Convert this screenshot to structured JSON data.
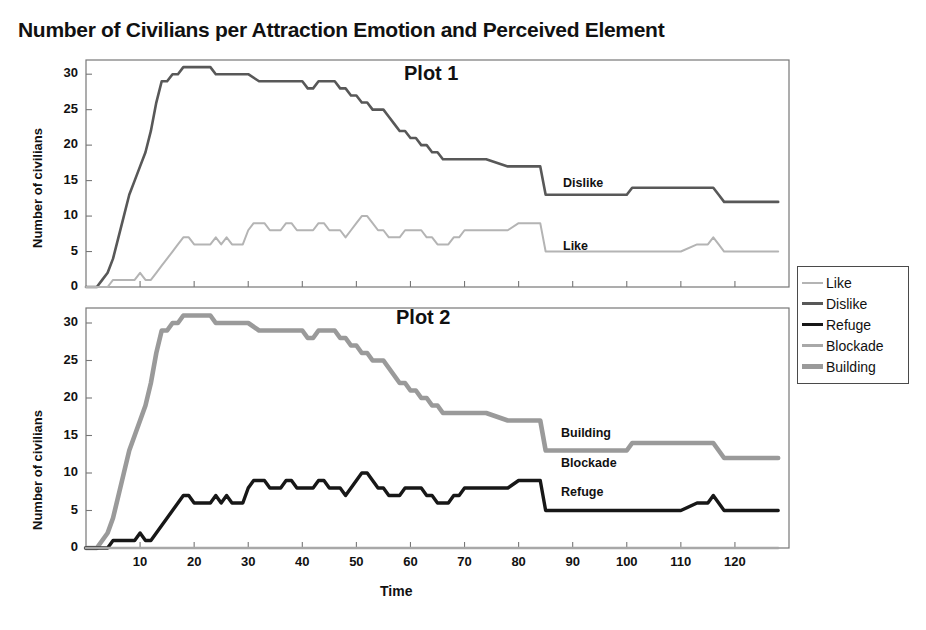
{
  "title": "Number of Civilians per Attraction Emotion and Perceived Element",
  "axis": {
    "xlabel": "Time",
    "ylabel": "Number of civilians",
    "yticks": [
      "0",
      "5",
      "10",
      "15",
      "20",
      "25",
      "30"
    ],
    "xticks": [
      "10",
      "20",
      "30",
      "40",
      "50",
      "60",
      "70",
      "80",
      "90",
      "100",
      "110",
      "120"
    ]
  },
  "plots": [
    {
      "tag": "Plot 1"
    },
    {
      "tag": "Plot 2"
    }
  ],
  "series_tags": {
    "dislike": "Dislike",
    "like": "Like",
    "building": "Building",
    "blockade": "Blockade",
    "refuge": "Refuge"
  },
  "legend": {
    "items": [
      {
        "label": "Like",
        "color": "#b4b4b4",
        "width": 2.0
      },
      {
        "label": "Dislike",
        "color": "#585858",
        "width": 2.6
      },
      {
        "label": "Refuge",
        "color": "#171717",
        "width": 3.4
      },
      {
        "label": "Blockade",
        "color": "#a8a8a8",
        "width": 2.4
      },
      {
        "label": "Building",
        "color": "#9a9a9a",
        "width": 4.6
      }
    ]
  },
  "chart_data": {
    "type": "line",
    "title": "Number of Civilians per Attraction Emotion and Perceived Element",
    "xlabel": "Time",
    "ylabel": "Number of civilians",
    "xlim": [
      0,
      130
    ],
    "ylim": [
      0,
      32
    ],
    "grid": false,
    "legend_position": "right-outside",
    "panels": [
      {
        "name": "Plot 1",
        "series": [
          {
            "name": "Dislike",
            "color": "#585858",
            "width": 2.6,
            "x": [
              0,
              1,
              2,
              3,
              4,
              5,
              6,
              7,
              8,
              9,
              10,
              11,
              12,
              13,
              14,
              15,
              16,
              17,
              18,
              19,
              20,
              21,
              22,
              23,
              24,
              25,
              26,
              27,
              28,
              29,
              30,
              32,
              34,
              36,
              38,
              40,
              41,
              42,
              43,
              44,
              45,
              46,
              47,
              48,
              49,
              50,
              51,
              52,
              53,
              54,
              55,
              56,
              57,
              58,
              59,
              60,
              61,
              62,
              63,
              64,
              65,
              66,
              70,
              74,
              78,
              80,
              82,
              84,
              85,
              86,
              90,
              95,
              100,
              101,
              102,
              106,
              110,
              114,
              116,
              117,
              118,
              120,
              124,
              128
            ],
            "y": [
              0,
              0,
              0,
              1,
              2,
              4,
              7,
              10,
              13,
              15,
              17,
              19,
              22,
              26,
              29,
              29,
              30,
              30,
              31,
              31,
              31,
              31,
              31,
              31,
              30,
              30,
              30,
              30,
              30,
              30,
              30,
              29,
              29,
              29,
              29,
              29,
              28,
              28,
              29,
              29,
              29,
              29,
              28,
              28,
              27,
              27,
              26,
              26,
              25,
              25,
              25,
              24,
              23,
              22,
              22,
              21,
              21,
              20,
              20,
              19,
              19,
              18,
              18,
              18,
              17,
              17,
              17,
              17,
              13,
              13,
              13,
              13,
              13,
              14,
              14,
              14,
              14,
              14,
              14,
              13,
              12,
              12,
              12,
              12
            ]
          },
          {
            "name": "Like",
            "color": "#b4b4b4",
            "width": 2.0,
            "x": [
              0,
              2,
              4,
              5,
              6,
              7,
              8,
              9,
              10,
              11,
              12,
              13,
              14,
              15,
              16,
              17,
              18,
              19,
              20,
              21,
              22,
              23,
              24,
              25,
              26,
              27,
              28,
              29,
              30,
              31,
              32,
              33,
              34,
              35,
              36,
              37,
              38,
              39,
              40,
              41,
              42,
              43,
              44,
              45,
              46,
              47,
              48,
              49,
              50,
              51,
              52,
              53,
              54,
              55,
              56,
              57,
              58,
              59,
              60,
              61,
              62,
              63,
              64,
              65,
              66,
              67,
              68,
              69,
              70,
              72,
              74,
              76,
              78,
              80,
              82,
              84,
              85,
              86,
              90,
              95,
              100,
              105,
              110,
              113,
              115,
              116,
              117,
              118,
              119,
              120,
              124,
              128
            ],
            "y": [
              0,
              0,
              0,
              1,
              1,
              1,
              1,
              1,
              2,
              1,
              1,
              2,
              3,
              4,
              5,
              6,
              7,
              7,
              6,
              6,
              6,
              6,
              7,
              6,
              7,
              6,
              6,
              6,
              8,
              9,
              9,
              9,
              8,
              8,
              8,
              9,
              9,
              8,
              8,
              8,
              8,
              9,
              9,
              8,
              8,
              8,
              7,
              8,
              9,
              10,
              10,
              9,
              8,
              8,
              7,
              7,
              7,
              8,
              8,
              8,
              8,
              7,
              7,
              6,
              6,
              6,
              7,
              7,
              8,
              8,
              8,
              8,
              8,
              9,
              9,
              9,
              5,
              5,
              5,
              5,
              5,
              5,
              5,
              6,
              6,
              7,
              6,
              5,
              5,
              5,
              5,
              5
            ]
          }
        ]
      },
      {
        "name": "Plot 2",
        "series": [
          {
            "name": "Building",
            "color": "#9a9a9a",
            "width": 4.6,
            "x": [
              0,
              1,
              2,
              3,
              4,
              5,
              6,
              7,
              8,
              9,
              10,
              11,
              12,
              13,
              14,
              15,
              16,
              17,
              18,
              19,
              20,
              21,
              22,
              23,
              24,
              25,
              26,
              27,
              28,
              29,
              30,
              32,
              34,
              36,
              38,
              40,
              41,
              42,
              43,
              44,
              45,
              46,
              47,
              48,
              49,
              50,
              51,
              52,
              53,
              54,
              55,
              56,
              57,
              58,
              59,
              60,
              61,
              62,
              63,
              64,
              65,
              66,
              70,
              74,
              78,
              80,
              82,
              84,
              85,
              86,
              90,
              95,
              100,
              101,
              102,
              106,
              110,
              114,
              116,
              117,
              118,
              120,
              124,
              128
            ],
            "y": [
              0,
              0,
              0,
              1,
              2,
              4,
              7,
              10,
              13,
              15,
              17,
              19,
              22,
              26,
              29,
              29,
              30,
              30,
              31,
              31,
              31,
              31,
              31,
              31,
              30,
              30,
              30,
              30,
              30,
              30,
              30,
              29,
              29,
              29,
              29,
              29,
              28,
              28,
              29,
              29,
              29,
              29,
              28,
              28,
              27,
              27,
              26,
              26,
              25,
              25,
              25,
              24,
              23,
              22,
              22,
              21,
              21,
              20,
              20,
              19,
              19,
              18,
              18,
              18,
              17,
              17,
              17,
              17,
              13,
              13,
              13,
              13,
              13,
              14,
              14,
              14,
              14,
              14,
              14,
              13,
              12,
              12,
              12,
              12
            ]
          },
          {
            "name": "Refuge",
            "color": "#171717",
            "width": 3.4,
            "x": [
              0,
              2,
              4,
              5,
              6,
              7,
              8,
              9,
              10,
              11,
              12,
              13,
              14,
              15,
              16,
              17,
              18,
              19,
              20,
              21,
              22,
              23,
              24,
              25,
              26,
              27,
              28,
              29,
              30,
              31,
              32,
              33,
              34,
              35,
              36,
              37,
              38,
              39,
              40,
              41,
              42,
              43,
              44,
              45,
              46,
              47,
              48,
              49,
              50,
              51,
              52,
              53,
              54,
              55,
              56,
              57,
              58,
              59,
              60,
              61,
              62,
              63,
              64,
              65,
              66,
              67,
              68,
              69,
              70,
              72,
              74,
              76,
              78,
              80,
              82,
              84,
              85,
              86,
              90,
              95,
              100,
              105,
              110,
              113,
              115,
              116,
              117,
              118,
              119,
              120,
              124,
              128
            ],
            "y": [
              0,
              0,
              0,
              1,
              1,
              1,
              1,
              1,
              2,
              1,
              1,
              2,
              3,
              4,
              5,
              6,
              7,
              7,
              6,
              6,
              6,
              6,
              7,
              6,
              7,
              6,
              6,
              6,
              8,
              9,
              9,
              9,
              8,
              8,
              8,
              9,
              9,
              8,
              8,
              8,
              8,
              9,
              9,
              8,
              8,
              8,
              7,
              8,
              9,
              10,
              10,
              9,
              8,
              8,
              7,
              7,
              7,
              8,
              8,
              8,
              8,
              7,
              7,
              6,
              6,
              6,
              7,
              7,
              8,
              8,
              8,
              8,
              8,
              9,
              9,
              9,
              5,
              5,
              5,
              5,
              5,
              5,
              5,
              6,
              6,
              7,
              6,
              5,
              5,
              5,
              5,
              5
            ]
          },
          {
            "name": "Blockade",
            "color": "#a8a8a8",
            "width": 2.4,
            "x": [
              0,
              10,
              20,
              40,
              60,
              80,
              100,
              120,
              128
            ],
            "y": [
              0,
              0,
              0,
              0,
              0,
              0,
              0,
              0,
              0
            ]
          }
        ]
      }
    ]
  }
}
